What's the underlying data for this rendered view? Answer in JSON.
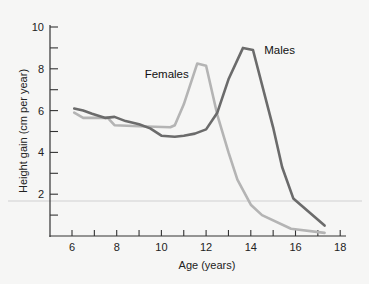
{
  "chart_data": {
    "type": "line",
    "title": "",
    "xlabel": "Age (years)",
    "ylabel": "Height gain (cm per year)",
    "xlim": [
      5,
      18.2
    ],
    "ylim": [
      0,
      10
    ],
    "x_ticks": [
      6,
      7,
      8,
      9,
      10,
      11,
      12,
      13,
      14,
      15,
      16,
      17,
      18
    ],
    "x_tick_labels": [
      "6",
      "",
      "8",
      "",
      "10",
      "",
      "12",
      "",
      "14",
      "",
      "16",
      "",
      "18"
    ],
    "y_ticks": [
      1,
      2,
      3,
      4,
      5,
      6,
      7,
      8,
      9,
      10
    ],
    "y_tick_labels": [
      "",
      "2",
      "",
      "4",
      "",
      "6",
      "",
      "8",
      "",
      "10"
    ],
    "grid": false,
    "legend": "inline labels",
    "series": [
      {
        "name": "Males",
        "color": "#6b6b6b",
        "label_pos": {
          "x": 14.6,
          "y": 8.7
        },
        "x": [
          6.1,
          6.5,
          6.9,
          7.5,
          7.9,
          8.4,
          9.0,
          9.5,
          10.0,
          10.6,
          11.0,
          11.5,
          12.0,
          12.5,
          13.0,
          13.65,
          14.1,
          15.0,
          15.4,
          15.9,
          17.3
        ],
        "values": [
          6.1,
          6.0,
          5.85,
          5.65,
          5.7,
          5.5,
          5.35,
          5.15,
          4.8,
          4.75,
          4.8,
          4.9,
          5.1,
          5.9,
          7.5,
          9.0,
          8.9,
          5.2,
          3.3,
          1.8,
          0.5
        ]
      },
      {
        "name": "Females",
        "color": "#b4b4b4",
        "label_pos": {
          "x": 9.25,
          "y": 7.55
        },
        "x": [
          6.1,
          6.5,
          7.6,
          7.9,
          9.0,
          10.4,
          10.6,
          11.0,
          11.6,
          12.0,
          12.5,
          13.0,
          13.4,
          14.0,
          14.5,
          15.8,
          17.3
        ],
        "values": [
          5.9,
          5.65,
          5.65,
          5.3,
          5.25,
          5.2,
          5.3,
          6.3,
          8.25,
          8.15,
          5.8,
          4.0,
          2.7,
          1.5,
          1.0,
          0.35,
          0.15
        ]
      }
    ]
  },
  "layout": {
    "plot_left": 50,
    "plot_bottom": 236,
    "x0_age": 6,
    "x0_px": 72,
    "px_per_year": 22.35,
    "px_per_unit": 20.9
  }
}
